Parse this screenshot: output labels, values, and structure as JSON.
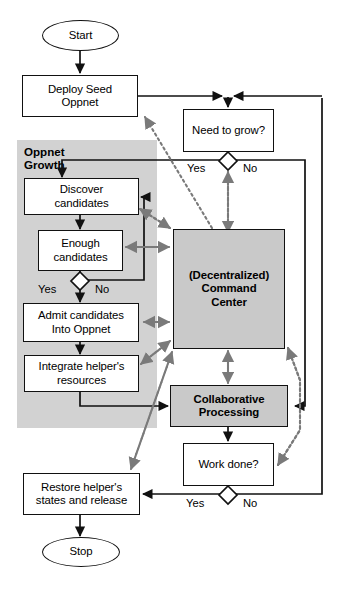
{
  "diagram": {
    "colors": {
      "panel_fill": "#d2d2d2",
      "shaded_node_fill": "#c9c9c9",
      "node_fill": "#ffffff",
      "stroke": "#111111",
      "dotted_stroke": "#808080",
      "background": "#ffffff"
    },
    "panel": {
      "label": "Oppnet\nGrowth"
    },
    "nodes": [
      {
        "id": "start",
        "shape": "terminal",
        "label": "Start"
      },
      {
        "id": "deploy",
        "shape": "process",
        "label": "Deploy Seed\nOppnet"
      },
      {
        "id": "need_grow",
        "shape": "process",
        "label": "Need to grow?"
      },
      {
        "id": "discover",
        "shape": "process",
        "label": "Discover\ncandidates"
      },
      {
        "id": "enough",
        "shape": "process",
        "label": "Enough\ncandidates"
      },
      {
        "id": "admit",
        "shape": "process",
        "label": "Admit candidates\nInto Oppnet"
      },
      {
        "id": "integrate",
        "shape": "process",
        "label": "Integrate helper's\nresources"
      },
      {
        "id": "command",
        "shape": "shaded",
        "label": "(Decentralized)\nCommand\nCenter"
      },
      {
        "id": "collab",
        "shape": "shaded",
        "label": "Collaborative\nProcessing"
      },
      {
        "id": "work_done",
        "shape": "process",
        "label": "Work done?"
      },
      {
        "id": "restore",
        "shape": "process",
        "label": "Restore helper's\nstates and release"
      },
      {
        "id": "stop",
        "shape": "terminal",
        "label": "Stop"
      }
    ],
    "decisions": [
      {
        "id": "need_grow_decision",
        "yes": "Yes",
        "no": "No"
      },
      {
        "id": "enough_decision",
        "yes": "Yes",
        "no": "No"
      },
      {
        "id": "work_done_decision",
        "yes": "Yes",
        "no": "No"
      }
    ],
    "branch_labels": {
      "need_yes": "Yes",
      "need_no": "No",
      "enough_yes": "Yes",
      "enough_no": "No",
      "work_yes": "Yes",
      "work_no": "No"
    }
  }
}
